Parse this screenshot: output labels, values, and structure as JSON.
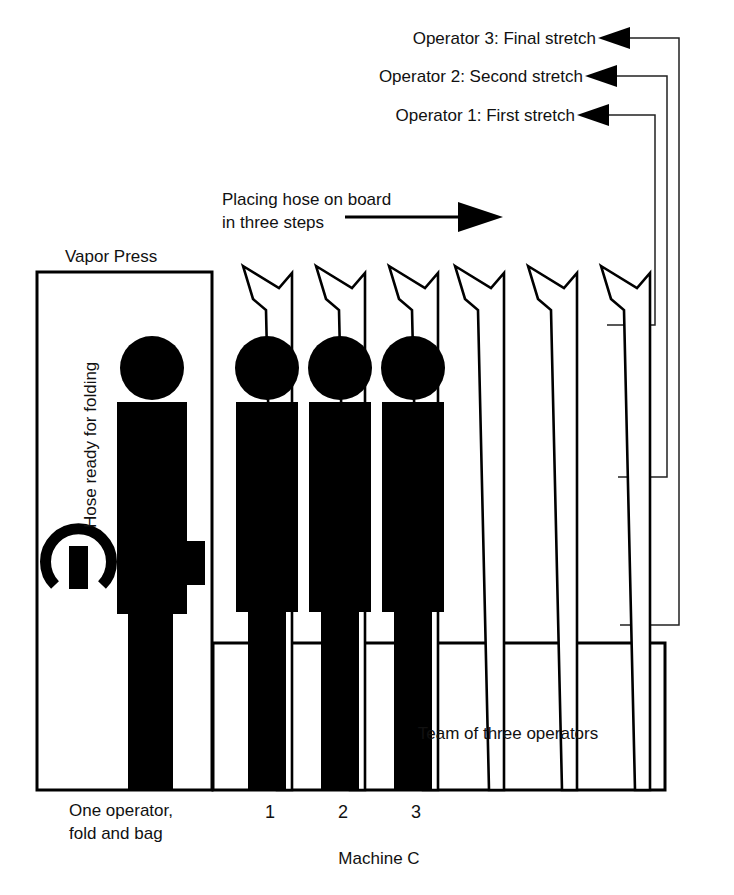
{
  "diagram": {
    "title_bottom": "Machine C",
    "annotations": {
      "placing_line1": "Placing hose on board",
      "placing_line2": "in three steps",
      "vapor_press": "Vapor Press",
      "hose_ready": "Hose ready for folding",
      "one_operator_line1": "One operator,",
      "one_operator_line2": "fold and bag",
      "team_of_three": "Team of three operators"
    },
    "operator_callouts": [
      {
        "id": "operator-3",
        "label": "Operator 3: Final stretch"
      },
      {
        "id": "operator-2",
        "label": "Operator 2: Second stretch"
      },
      {
        "id": "operator-1",
        "label": "Operator 1: First stretch"
      }
    ],
    "station_numbers": [
      "1",
      "2",
      "3"
    ],
    "colors": {
      "ink": "#000000",
      "background": "#ffffff",
      "leader_line": "#222222"
    }
  }
}
